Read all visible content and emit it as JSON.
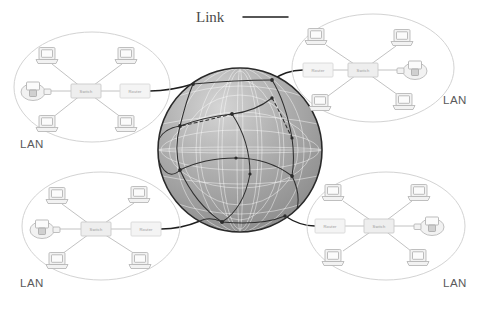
{
  "figure": {
    "title": "",
    "background_color": "#ffffff",
    "width": 481,
    "height": 311
  },
  "legend": {
    "label": "Link",
    "line_color": "#3a3a3a",
    "icon": "horizontal-line-icon"
  },
  "globe": {
    "name": "internet-globe",
    "label": "",
    "fill_color": "#a8a8a8",
    "grid_color": "#ffffff",
    "link_color": "#2f2f2f",
    "center_x": 240,
    "center_y": 150,
    "radius": 82
  },
  "lans": [
    {
      "id": "lan-top-left",
      "label": "LAN",
      "label_x": 20,
      "label_y": 148,
      "ellipse": {
        "cx": 92,
        "cy": 87,
        "rx": 78,
        "ry": 55
      },
      "switch": {
        "label": "Switch",
        "x": 86,
        "y": 91
      },
      "router": {
        "label": "Router",
        "x": 134,
        "y": 91
      },
      "printer_side": "left",
      "hosts": [
        {
          "label": "",
          "x": 47,
          "y": 56
        },
        {
          "label": "",
          "x": 126,
          "y": 56
        },
        {
          "label": "",
          "x": 47,
          "y": 124
        },
        {
          "label": "",
          "x": 126,
          "y": 124
        }
      ],
      "printer": {
        "label": "",
        "x": 33,
        "y": 91
      }
    },
    {
      "id": "lan-top-right",
      "label": "LAN",
      "label_x": 443,
      "label_y": 104,
      "ellipse": {
        "cx": 373,
        "cy": 68,
        "rx": 81,
        "ry": 54
      },
      "router": {
        "label": "Router",
        "x": 318,
        "y": 70
      },
      "switch": {
        "label": "Switch",
        "x": 363,
        "y": 70
      },
      "printer_side": "right",
      "hosts": [
        {
          "label": "",
          "x": 316,
          "y": 37
        },
        {
          "label": "",
          "x": 402,
          "y": 38
        },
        {
          "label": "",
          "x": 320,
          "y": 103
        },
        {
          "label": "",
          "x": 404,
          "y": 102
        }
      ],
      "printer": {
        "label": "",
        "x": 415,
        "y": 70
      }
    },
    {
      "id": "lan-bottom-left",
      "label": "LAN",
      "label_x": 20,
      "label_y": 287,
      "ellipse": {
        "cx": 101,
        "cy": 226,
        "rx": 79,
        "ry": 54
      },
      "switch": {
        "label": "Switch",
        "x": 96,
        "y": 229
      },
      "router": {
        "label": "Router",
        "x": 145,
        "y": 229
      },
      "printer_side": "left",
      "hosts": [
        {
          "label": "",
          "x": 57,
          "y": 196
        },
        {
          "label": "",
          "x": 139,
          "y": 195
        },
        {
          "label": "",
          "x": 57,
          "y": 261
        },
        {
          "label": "",
          "x": 140,
          "y": 261
        }
      ],
      "printer": {
        "label": "",
        "x": 42,
        "y": 229
      }
    },
    {
      "id": "lan-bottom-right",
      "label": "LAN",
      "label_x": 443,
      "label_y": 287,
      "ellipse": {
        "cx": 386,
        "cy": 226,
        "rx": 79,
        "ry": 54
      },
      "router": {
        "label": "Router",
        "x": 330,
        "y": 226
      },
      "switch": {
        "label": "Switch",
        "x": 379,
        "y": 226
      },
      "printer_side": "right",
      "hosts": [
        {
          "label": "",
          "x": 333,
          "y": 193
        },
        {
          "label": "",
          "x": 419,
          "y": 193
        },
        {
          "label": "",
          "x": 333,
          "y": 258
        },
        {
          "label": "",
          "x": 418,
          "y": 258
        }
      ],
      "printer": {
        "label": "",
        "x": 432,
        "y": 226
      }
    }
  ],
  "icons": {
    "host": "laptop-computer-icon",
    "printer": "printer-icon",
    "switch": "switch-box-icon",
    "router": "router-box-icon"
  }
}
